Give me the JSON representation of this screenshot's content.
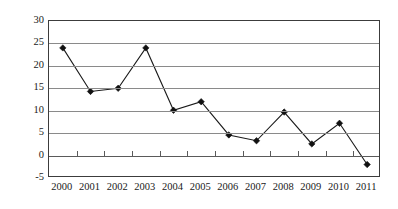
{
  "chart_data": {
    "type": "line",
    "title": "",
    "subtitle": "",
    "xlabel": "",
    "ylabel": "",
    "categories": [
      "2000",
      "2001",
      "2002",
      "2003",
      "2004",
      "2005",
      "2006",
      "2007",
      "2008",
      "2009",
      "2010",
      "2011"
    ],
    "values": [
      24,
      14.3,
      15,
      24,
      10.1,
      12,
      4.6,
      3.3,
      9.7,
      2.6,
      7.2,
      -2
    ],
    "series": [
      {
        "name": "",
        "values": [
          24,
          14.3,
          15,
          24,
          10.1,
          12,
          4.6,
          3.3,
          9.7,
          2.6,
          7.2,
          -2
        ]
      }
    ],
    "ylim": [
      -5,
      30
    ],
    "xlim": [
      0,
      11
    ],
    "ytick_labels": [
      "30",
      "25",
      "20",
      "15",
      "10",
      "5",
      "0",
      "-5"
    ],
    "ytick_values": [
      30,
      25,
      20,
      15,
      10,
      5,
      0,
      -5
    ],
    "ytick_step": 5,
    "grid": true,
    "grid_axis": "y",
    "legend": false,
    "legend_position": "none",
    "marker": "diamond",
    "marker_color": "#111111",
    "line_color": "#1a1a1a",
    "gridline_color": "#8a8a8a",
    "plot_border_color": "#3c3c3c",
    "background_color": "#ffffff",
    "annotations": []
  }
}
